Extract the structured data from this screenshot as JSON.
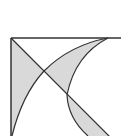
{
  "diagram": {
    "type": "geometry",
    "colors": {
      "stroke": "#333333",
      "fill": "#d9d9d9",
      "background": "#ffffff"
    }
  }
}
